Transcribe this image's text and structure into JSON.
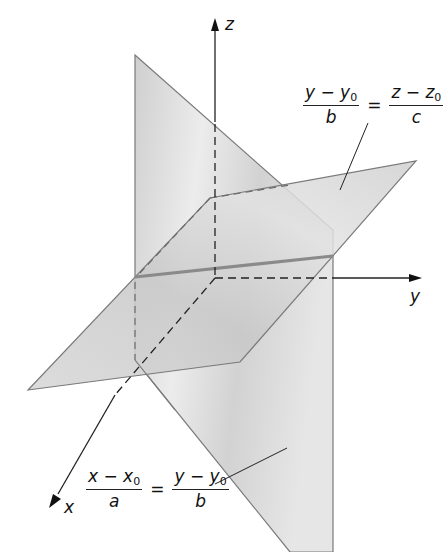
{
  "diagram": {
    "type": "3d-line-as-intersection-of-planes",
    "axes": {
      "x_label": "x",
      "y_label": "y",
      "z_label": "z"
    },
    "plane_upper": {
      "equation": {
        "left_num_var": "y − y",
        "left_num_sub": "0",
        "left_den": "b",
        "equals": "=",
        "right_num_var": "z − z",
        "right_num_sub": "0",
        "right_den": "c"
      }
    },
    "plane_lower": {
      "equation": {
        "left_num_var": "x − x",
        "left_num_sub": "0",
        "left_den": "a",
        "equals": "=",
        "right_num_var": "y − y",
        "right_num_sub": "0",
        "right_den": "b"
      }
    },
    "colors": {
      "plane_fill": "#d4d4d4",
      "plane_edge": "#7a7a7a",
      "intersection_line": "#8a8a8a",
      "axis": "#222222"
    }
  }
}
